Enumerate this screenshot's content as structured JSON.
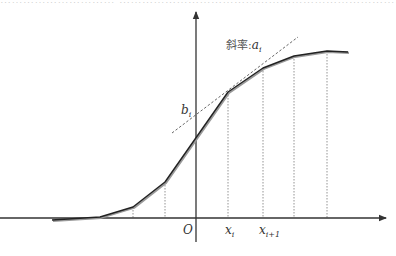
{
  "diagram": {
    "title_strip": "………………………… ………………………………………………………………… ………………………………",
    "colors": {
      "axis": "#333333",
      "curve": "#222222",
      "curve_shadow": "#9a9a9a",
      "dashed": "#888888",
      "tangent": "#555555",
      "background": "#ffffff"
    },
    "axes": {
      "origin_label": "O",
      "x_axis": {
        "y": 218,
        "x_start": 0,
        "x_end": 386
      },
      "y_axis": {
        "x": 196,
        "y_start": 242,
        "y_end": 12
      }
    },
    "curve_points": [
      [
        52,
        220
      ],
      [
        100,
        217
      ],
      [
        133,
        207
      ],
      [
        165,
        182
      ],
      [
        228,
        92
      ],
      [
        263,
        68
      ],
      [
        294,
        56
      ],
      [
        327,
        51
      ],
      [
        348,
        52
      ]
    ],
    "knot_verticals_x": [
      100,
      133,
      165,
      228,
      263,
      294,
      327
    ],
    "tangent_line": {
      "x1": 172,
      "y1": 133,
      "x2": 298,
      "y2": 37
    },
    "labels": {
      "slope_prefix": "斜率:",
      "slope_var": "a",
      "slope_sub": "i",
      "intercept_var": "b",
      "intercept_sub": "i",
      "xi_var": "x",
      "xi_sub": "i",
      "xi1_var": "x",
      "xi1_sub": "i+1"
    }
  }
}
